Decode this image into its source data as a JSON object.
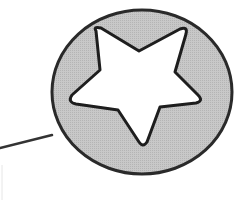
{
  "diagram": {
    "shapes": [
      {
        "id": "badge-circle",
        "type": "ellipse",
        "icon": "circle-badge",
        "cx": 142,
        "cy": 92,
        "rx": 90,
        "ry": 82,
        "fill": "#c4c4c4",
        "stroke": "#2a2a2a",
        "stroke_width": 3
      },
      {
        "id": "star",
        "type": "star",
        "icon": "star-icon",
        "points": 5,
        "fill": "#ffffff",
        "stroke": "#1e1e1e",
        "stroke_width": 3
      },
      {
        "id": "leader-line",
        "type": "line",
        "x1": 0,
        "y1": 148,
        "x2": 52,
        "y2": 135,
        "stroke": "#333333",
        "stroke_width": 2.5
      },
      {
        "id": "faint-edge",
        "type": "line",
        "x1": 2,
        "y1": 165,
        "x2": 2,
        "y2": 200,
        "stroke": "#e6e6e6",
        "stroke_width": 1
      }
    ],
    "colors": {
      "background": "#ffffff",
      "circle_fill": "#c4c4c4",
      "outline": "#222222",
      "star_fill": "#ffffff"
    }
  }
}
